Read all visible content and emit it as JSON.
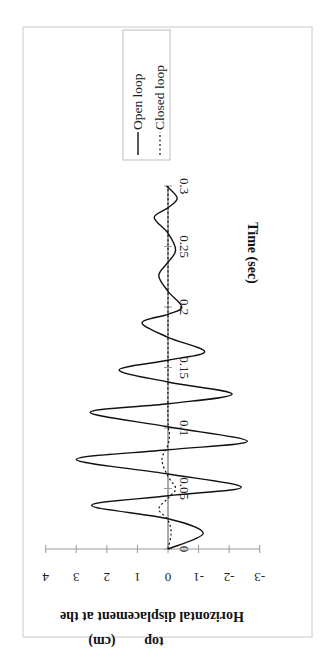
{
  "chart_data": {
    "type": "line",
    "orientation": "rotated 90 degrees (time axis runs vertically from bottom to top, displacement axis horizontal with positive to the left)",
    "title": "",
    "xlabel": "Time (sec)",
    "ylabel": "Horizontal displacement at the top (cm)",
    "ylabel_lines": [
      "Horizontal displacement at the",
      "top",
      "(cm)"
    ],
    "xlim": [
      0,
      0.3
    ],
    "ylim": [
      -3,
      4
    ],
    "x_ticks": [
      "0",
      "0.05",
      "0.1",
      "0.15",
      "0.2",
      "0.25",
      "0.3"
    ],
    "y_ticks": [
      "4",
      "3",
      "2",
      "1",
      "0",
      "-1",
      "-2",
      "-3"
    ],
    "grid": false,
    "legend": {
      "position": "upper right (rotated)",
      "entries": [
        "Open loop",
        "Closed loop"
      ]
    },
    "series": [
      {
        "name": "Open loop",
        "style": "solid",
        "x": [
          0,
          0.013,
          0.025,
          0.036,
          0.044,
          0.051,
          0.062,
          0.074,
          0.082,
          0.089,
          0.101,
          0.113,
          0.12,
          0.128,
          0.138,
          0.148,
          0.156,
          0.163,
          0.175,
          0.187,
          0.194,
          0.2,
          0.213,
          0.226,
          0.237,
          0.247,
          0.261,
          0.274,
          0.282,
          0.29,
          0.3
        ],
        "values": [
          0,
          -1.15,
          0,
          2.5,
          0,
          -2.4,
          0,
          3.0,
          0,
          -2.6,
          0,
          2.55,
          0,
          -2.1,
          0,
          1.6,
          0,
          -1.2,
          0,
          0.85,
          0,
          -0.45,
          0,
          0.3,
          0,
          -0.25,
          0,
          0.45,
          0,
          -0.3,
          0.05
        ]
      },
      {
        "name": "Closed loop",
        "style": "dotted",
        "x": [
          0,
          0.013,
          0.024,
          0.033,
          0.042,
          0.05,
          0.06,
          0.074,
          0.086,
          0.095,
          0.105,
          0.15,
          0.2,
          0.25,
          0.3
        ],
        "values": [
          0,
          -0.1,
          0,
          0.3,
          0,
          -0.25,
          0,
          0.2,
          0,
          -0.05,
          0,
          0,
          0,
          0,
          0
        ]
      }
    ]
  },
  "legend": {
    "open_loop": "Open loop",
    "closed_loop": "Closed loop"
  },
  "axes": {
    "time_label": "Time (sec)",
    "disp_label_line1": "Horizontal displacement at the",
    "disp_label_line2": "top",
    "disp_label_line3": "(cm)",
    "time_ticks": [
      "0",
      "0.05",
      "0.1",
      "0.15",
      "0.2",
      "0.25",
      "0.3"
    ],
    "disp_ticks": [
      "4",
      "3",
      "2",
      "1",
      "0",
      "-1",
      "-2",
      "-3"
    ]
  }
}
